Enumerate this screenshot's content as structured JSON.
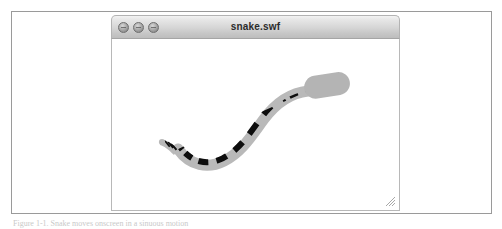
{
  "figure": {
    "caption": "Figure 1-1. Snake moves onscreen in a sinuous motion"
  },
  "window": {
    "title": "snake.swf",
    "controls": [
      {
        "name": "close",
        "label": "Close"
      },
      {
        "name": "minimize",
        "label": "Minimize"
      },
      {
        "name": "zoom",
        "label": "Zoom"
      }
    ],
    "resize_grip_label": "Resize"
  },
  "stage": {
    "background_color": "#ffffff",
    "artwork_name": "snake"
  },
  "colors": {
    "body_light": "#b9b9b9",
    "body_dark": "#0d0d0d",
    "head_fill": "#b4b4b4",
    "frame_border": "#9a9a9a",
    "titlebar_top": "#f3f3f3",
    "titlebar_bottom": "#bdbdbd"
  }
}
